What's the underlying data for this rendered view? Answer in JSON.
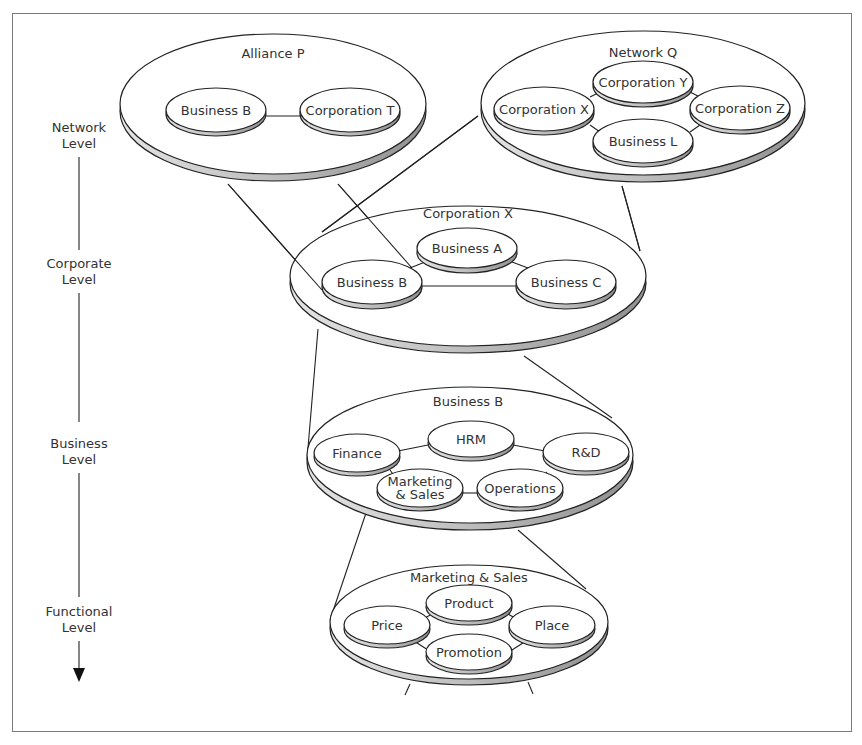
{
  "diagram": {
    "levels": [
      {
        "line1": "Network",
        "line2": "Level"
      },
      {
        "line1": "Corporate",
        "line2": "Level"
      },
      {
        "line1": "Business",
        "line2": "Level"
      },
      {
        "line1": "Functional",
        "line2": "Level"
      }
    ],
    "network_alliance": {
      "title": "Alliance P",
      "nodes": [
        "Business B",
        "Corporation T"
      ]
    },
    "network_q": {
      "title": "Network Q",
      "nodes": [
        "Corporation Y",
        "Corporation X",
        "Corporation Z",
        "Business L"
      ]
    },
    "corporate": {
      "title": "Corporation X",
      "nodes": [
        "Business A",
        "Business B",
        "Business C"
      ]
    },
    "business": {
      "title": "Business B",
      "nodes": [
        "HRM",
        "Finance",
        "R&D",
        "Marketing",
        "& Sales",
        "Operations"
      ]
    },
    "functional": {
      "title": "Marketing & Sales",
      "nodes": [
        "Product",
        "Price",
        "Place",
        "Promotion"
      ]
    },
    "colors": {
      "line": "#222222",
      "disc_fill": "#ffffff",
      "disc_edge": "#aaaaaa",
      "frame": "#7a7a7a",
      "text": "#333333"
    }
  }
}
